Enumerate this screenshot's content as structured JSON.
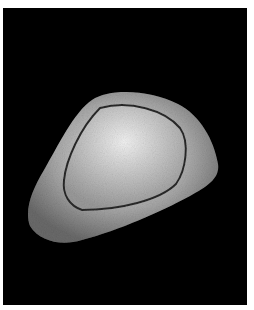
{
  "image": {
    "subject": "seed",
    "background_color": "#000000",
    "border_color": "#ffffff",
    "object_color": "#b8b8b8",
    "highlight_color": "#e6e6e6"
  }
}
